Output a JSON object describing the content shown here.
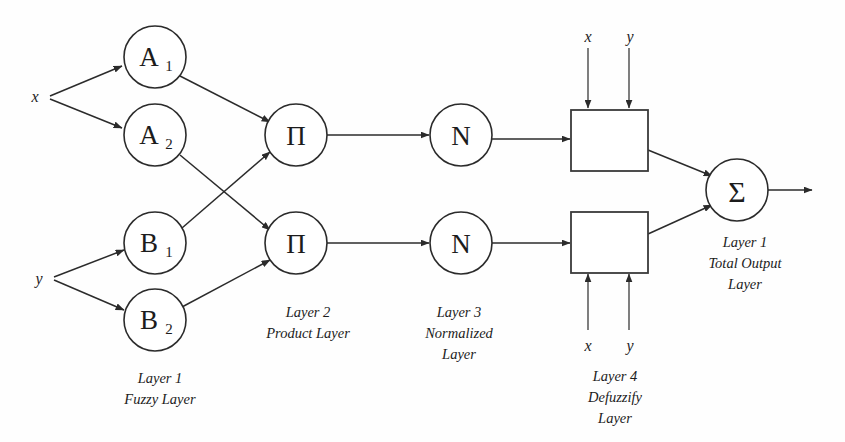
{
  "diagram": {
    "background_color": "#fefefe",
    "stroke_color": "#2b2b2b"
  },
  "inputs": {
    "x_label": "x",
    "y_label": "y"
  },
  "fuzzy_nodes": [
    {
      "id": "A1",
      "base": "A",
      "sub": "1"
    },
    {
      "id": "A2",
      "base": "A",
      "sub": "2"
    },
    {
      "id": "B1",
      "base": "B",
      "sub": "1"
    },
    {
      "id": "B2",
      "base": "B",
      "sub": "2"
    }
  ],
  "product_nodes": [
    {
      "id": "prod-top",
      "symbol": "Π"
    },
    {
      "id": "prod-bottom",
      "symbol": "Π"
    }
  ],
  "normalized_nodes": [
    {
      "id": "norm-top",
      "symbol": "N"
    },
    {
      "id": "norm-bottom",
      "symbol": "N"
    }
  ],
  "defuzzify_nodes": [
    {
      "id": "defuzz-top",
      "input_x": "x",
      "input_y": "y"
    },
    {
      "id": "defuzz-bottom",
      "input_x": "x",
      "input_y": "y"
    }
  ],
  "output_node": {
    "id": "sum-node",
    "symbol": "Σ"
  },
  "captions": {
    "layer1": {
      "line1": "Layer 1",
      "line2": "Fuzzy Layer"
    },
    "layer2": {
      "line1": "Layer 2",
      "line2": "Product Layer"
    },
    "layer3": {
      "line1": "Layer 3",
      "line2": "Normalized",
      "line3": "Layer"
    },
    "layer4": {
      "line1": "Layer 4",
      "line2": "Defuzzify",
      "line3": "Layer"
    },
    "layer5": {
      "line1": "Layer 1",
      "line2": "Total Output",
      "line3": "Layer"
    }
  }
}
